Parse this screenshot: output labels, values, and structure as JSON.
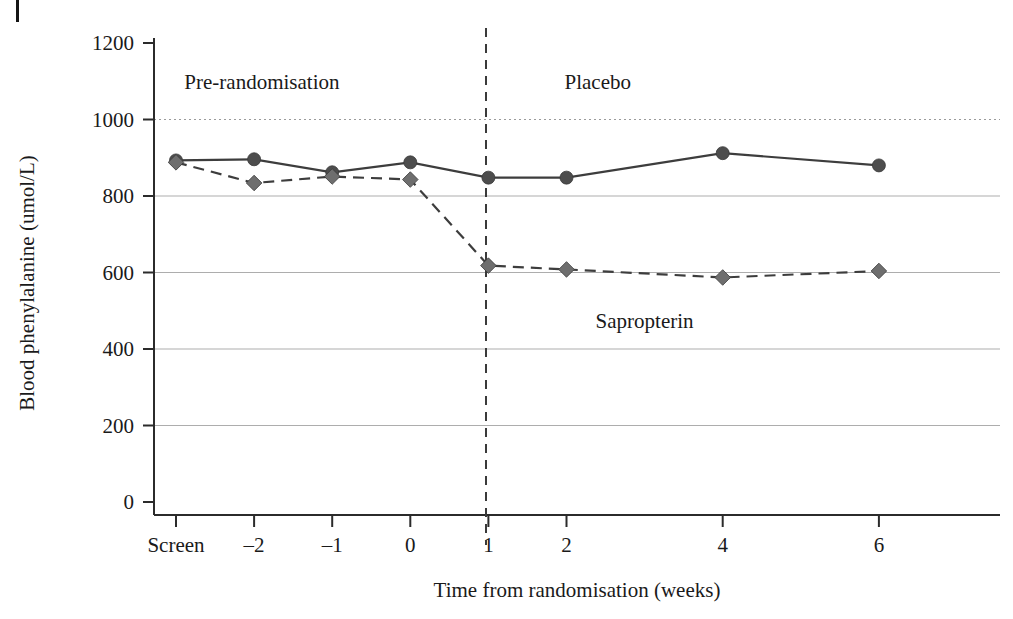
{
  "figure": {
    "corner_marker": "|",
    "background": "#ffffff"
  },
  "chart_data": {
    "type": "line",
    "title": "",
    "xlabel": "Time from randomisation (weeks)",
    "ylabel": "Blood phenylalanine (umol/L)",
    "categories": [
      "Screen",
      "-2",
      "-1",
      "0",
      "1",
      "2",
      "4",
      "6"
    ],
    "x": [
      -3,
      -2,
      -1,
      0,
      1,
      2,
      4,
      6
    ],
    "xtick_labels": [
      "Screen",
      "–2",
      "–1",
      "0",
      "1",
      "2",
      "4",
      "6"
    ],
    "ytick_labels": [
      "0",
      "200",
      "400",
      "600",
      "800",
      "1000",
      "1200"
    ],
    "yticks": [
      0,
      200,
      400,
      600,
      800,
      1000,
      1200
    ],
    "ylim": [
      0,
      1200
    ],
    "grid": true,
    "grid_styles": {
      "200": "solid",
      "400": "solid",
      "600": "solid",
      "800": "solid",
      "1000": "dotted",
      "1200": "none"
    },
    "legend_position": "inline-annotations",
    "series": [
      {
        "name": "Placebo",
        "marker": "circle",
        "line_style": "solid",
        "color": "#4d4d4d",
        "values": [
          893,
          896,
          862,
          888,
          848,
          848,
          912,
          880
        ]
      },
      {
        "name": "Sapropterin",
        "marker": "diamond",
        "line_style": "dashed",
        "color": "#6e6e6e",
        "values": [
          888,
          834,
          851,
          843,
          618,
          608,
          587,
          604
        ]
      }
    ],
    "annotations": [
      {
        "text": "Pre-randomisation",
        "x": -1.9,
        "y": 1080,
        "name": "pre-randomisation-label"
      },
      {
        "text": "Placebo",
        "x": 2.4,
        "y": 1080,
        "name": "placebo-label"
      },
      {
        "text": "Sapropterin",
        "x": 3.0,
        "y": 455,
        "name": "sapropterin-label"
      }
    ],
    "reference_line": {
      "x": 0,
      "style": "dashed",
      "color": "#3a3a3a",
      "name": "randomisation-divider"
    }
  }
}
